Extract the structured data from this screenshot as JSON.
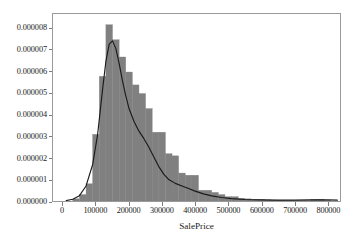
{
  "chart_data": {
    "type": "bar",
    "title": "",
    "subtitle": "",
    "xlabel": "SalePrice",
    "ylabel": "",
    "xlim": [
      -30000,
      838000
    ],
    "ylim": [
      0,
      8.7e-06
    ],
    "grid": false,
    "legend": null,
    "bar_color": "#808080",
    "bar_edge_color": "#808080",
    "line_color": "#1a1a1a",
    "frame_color": "#9a9a9a",
    "background": "#ffffff",
    "xticks": [
      0,
      100000,
      200000,
      300000,
      400000,
      500000,
      600000,
      700000,
      800000
    ],
    "xtick_labels": [
      "0",
      "100000",
      "200000",
      "300000",
      "400000",
      "500000",
      "600000",
      "700000",
      "800000"
    ],
    "yticks": [
      0.0,
      1e-06,
      2e-06,
      3e-06,
      4e-06,
      5e-06,
      6e-06,
      7e-06,
      8e-06
    ],
    "ytick_labels": [
      "0.000000",
      "0.000001",
      "0.000002",
      "0.000003",
      "0.000004",
      "0.000005",
      "0.000006",
      "0.000007",
      "0.000008"
    ],
    "bin_width": 20000,
    "bin_edges": [
      30000,
      50000,
      70000,
      90000,
      110000,
      130000,
      150000,
      170000,
      190000,
      210000,
      230000,
      250000,
      270000,
      290000,
      310000,
      330000,
      350000,
      370000,
      390000,
      410000,
      430000,
      450000,
      470000,
      490000,
      510000,
      530000,
      550000,
      570000,
      590000,
      610000,
      630000,
      650000,
      670000,
      690000,
      710000,
      730000,
      750000,
      770000,
      790000,
      810000
    ],
    "values": [
      1e-07,
      3e-07,
      8e-07,
      3.1e-06,
      5.8e-06,
      8.2e-06,
      7.5e-06,
      6.7e-06,
      6e-06,
      5.4e-06,
      5e-06,
      4.3e-06,
      3.2e-06,
      3.2e-06,
      2.2e-06,
      2.1e-06,
      1.3e-06,
      1.2e-06,
      1.2e-06,
      5e-07,
      5e-07,
      4e-07,
      3e-07,
      2e-07,
      2e-07,
      1.3e-07,
      1e-07,
      8e-08,
      7e-08,
      5e-08,
      4e-08,
      4e-08,
      3e-08,
      2e-08,
      2e-08,
      2e-08,
      7e-08,
      8e-08,
      3e-08
    ],
    "kde": {
      "name": "density",
      "x": [
        10000,
        30000,
        50000,
        70000,
        90000,
        105000,
        120000,
        130000,
        140000,
        150000,
        160000,
        170000,
        180000,
        190000,
        200000,
        215000,
        230000,
        245000,
        260000,
        275000,
        290000,
        305000,
        320000,
        340000,
        360000,
        380000,
        400000,
        425000,
        450000,
        480000,
        510000,
        550000,
        600000,
        650000,
        700000,
        750000,
        800000,
        830000
      ],
      "y": [
        2e-08,
        8e-08,
        2.5e-07,
        7e-07,
        1.7e-06,
        3.1e-06,
        5.2e-06,
        6.5e-06,
        7.3e-06,
        7.45e-06,
        7.1e-06,
        6.4e-06,
        5.6e-06,
        4.9e-06,
        4.3e-06,
        3.7e-06,
        3.25e-06,
        2.9e-06,
        2.5e-06,
        2.05e-06,
        1.6e-06,
        1.25e-06,
        1e-06,
        8.2e-07,
        7e-07,
        5.8e-07,
        4.6e-07,
        3.3e-07,
        2.4e-07,
        1.6e-07,
        1.1e-07,
        7e-08,
        5e-08,
        4e-08,
        4e-08,
        5e-08,
        5e-08,
        4e-08
      ]
    }
  }
}
